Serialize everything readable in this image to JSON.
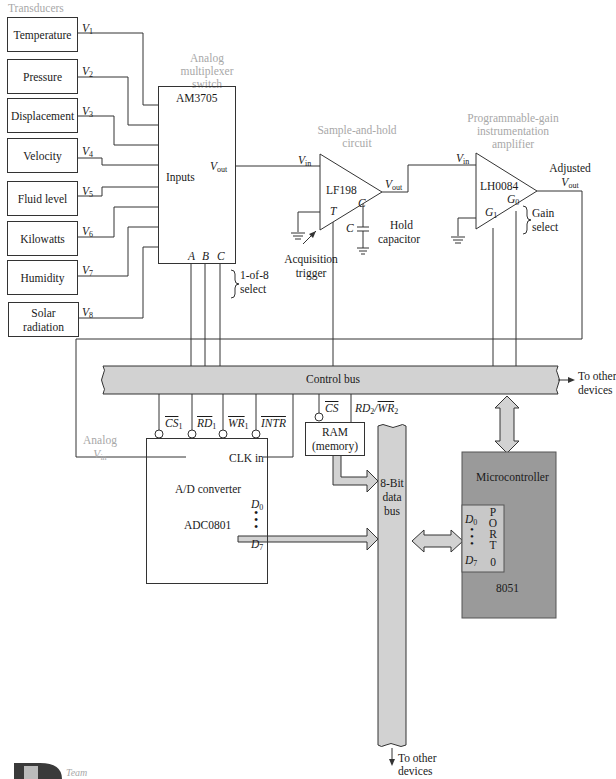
{
  "figure": {
    "headers": {
      "transducers": "Transducers",
      "mux": [
        "Analog",
        "multiplexer",
        "switch"
      ],
      "sample_hold": [
        "Sample-and-hold",
        "circuit"
      ],
      "pga": [
        "Programmable-gain",
        "instrumentation",
        "amplifier"
      ]
    },
    "transducers": [
      {
        "label": "Temperature",
        "signal": "V",
        "sub": "1"
      },
      {
        "label": "Pressure",
        "signal": "V",
        "sub": "2"
      },
      {
        "label": "Displacement",
        "signal": "V",
        "sub": "3"
      },
      {
        "label": "Velocity",
        "signal": "V",
        "sub": "4"
      },
      {
        "label": "Fluid level",
        "signal": "V",
        "sub": "5"
      },
      {
        "label": "Kilowatts",
        "signal": "V",
        "sub": "6"
      },
      {
        "label": "Humidity",
        "signal": "V",
        "sub": "7"
      },
      {
        "label": "Solar radiation",
        "signal": "V",
        "sub": "8"
      }
    ],
    "mux": {
      "part": "AM3705",
      "inputs_label": "Inputs",
      "vout": "V",
      "vout_sub": "out",
      "select_pins": [
        "A",
        "B",
        "C"
      ],
      "select_note": [
        "1-of-8",
        "select"
      ]
    },
    "sample_hold": {
      "part": "LF198",
      "vin": "V",
      "vin_sub": "in",
      "vout": "V",
      "vout_sub": "out",
      "pin_c": "C",
      "pin_t": "T",
      "cap_label": "C",
      "cap_note": [
        "Hold",
        "capacitor"
      ],
      "trigger_note": [
        "Acquisition",
        "trigger"
      ]
    },
    "pga": {
      "part": "LH0084",
      "vin": "V",
      "vin_sub": "in",
      "g0": "G",
      "g0_sub": "0",
      "g1": "G",
      "g1_sub": "1",
      "output_note": "Adjusted",
      "vout": "V",
      "vout_sub": "out",
      "gain_note": [
        "Gain",
        "select"
      ]
    },
    "control_bus": {
      "label": "Control bus",
      "to_other": [
        "To other",
        "devices"
      ]
    },
    "adc": {
      "title": "A/D converter",
      "part": "ADC0801",
      "clk": "CLK in",
      "pins": [
        {
          "name": "CS",
          "sub": "1"
        },
        {
          "name": "RD",
          "sub": "1"
        },
        {
          "name": "WR",
          "sub": "1"
        },
        {
          "name": "INTR",
          "sub": ""
        }
      ],
      "d0": "D",
      "d0_sub": "0",
      "d7": "D",
      "d7_sub": "7",
      "analog_in": [
        "Analog",
        "V"
      ],
      "analog_in_sub": "in"
    },
    "ram": {
      "title": "RAM",
      "subtitle": "(memory)",
      "cs": "CS",
      "rdwr": "RD",
      "rdwr_sub": "2",
      "rdwr_sep": "/",
      "wr": "WR",
      "wr_sub": "2"
    },
    "data_bus": {
      "label": [
        "8-Bit",
        "data",
        "bus"
      ],
      "to_other": [
        "To other",
        "devices"
      ]
    },
    "mcu": {
      "title": "Microcontroller",
      "part": "8051",
      "d0": "D",
      "d0_sub": "0",
      "d7": "D",
      "d7_sub": "7",
      "port_letters": [
        "P",
        "O",
        "R",
        "T"
      ],
      "port_num": "0"
    },
    "logo": {
      "text": "Team"
    },
    "colors": {
      "line": "#333333",
      "bus_fill": "#d2d2d2",
      "mcu_fill": "#9a9a9a",
      "mcu_port_fill": "#c8c8c8",
      "caption_gray": "#a8a8a8"
    }
  }
}
